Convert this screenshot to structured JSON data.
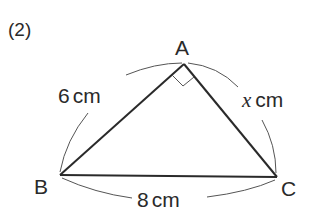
{
  "problem": {
    "number": "(2)"
  },
  "triangle": {
    "vertices": {
      "A": "A",
      "B": "B",
      "C": "C"
    },
    "right_angle_at": "A",
    "sides": {
      "AB": {
        "value": "6",
        "unit": "cm"
      },
      "AC": {
        "variable": "x",
        "unit": "cm"
      },
      "BC": {
        "value": "8",
        "unit": "cm"
      }
    }
  },
  "colors": {
    "line": "#2a2a2a",
    "arc": "#555555",
    "background": "#ffffff"
  }
}
